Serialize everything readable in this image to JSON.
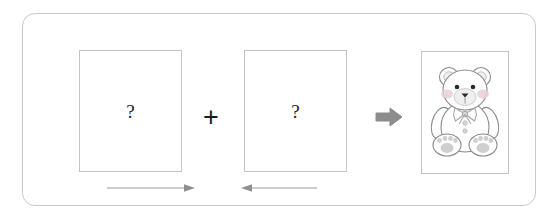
{
  "panel": {
    "border_color": "#c9c9c9",
    "background": "#ffffff"
  },
  "slots": [
    {
      "name": "first-unknown-card",
      "placeholder_glyph": "?",
      "border_color": "#c4c4c4"
    },
    {
      "name": "second-unknown-card",
      "placeholder_glyph": "?",
      "border_color": "#c4c4c4"
    }
  ],
  "operators": {
    "combine_glyph": "+",
    "result_icon": "right-block-arrow",
    "result_icon_color": "#8c8c8c"
  },
  "direction_markers": [
    {
      "name": "left-to-right-arrow",
      "glyph": "→",
      "direction": "right",
      "color": "#9a9a9a"
    },
    {
      "name": "right-to-left-arrow",
      "glyph": "←",
      "direction": "left",
      "color": "#9a9a9a"
    }
  ],
  "result": {
    "name": "teddy-bear-picture",
    "subject": "teddy-bear",
    "frame_border_color": "#c4c4c4",
    "outline_color": "#8a8a8a",
    "blush_color": "#e8cfd2",
    "muzzle_color": "#eeeeee",
    "paw_pad_color": "#cfcfcf",
    "eye_color": "#2b2b2b",
    "nose_color": "#2b2b2b",
    "bow_color": "#b8b8b8",
    "button_color": "#cfcfcf"
  }
}
